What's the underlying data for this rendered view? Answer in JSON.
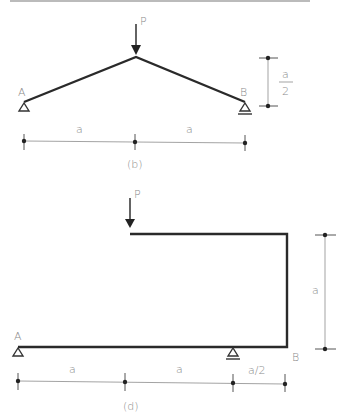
{
  "figures": [
    {
      "id": "b",
      "caption": "(b)",
      "load_label": "P",
      "support_left_label": "A",
      "support_right_label": "B",
      "support_left_type": "pin",
      "support_right_type": "roller",
      "horizontal_dimensions": [
        "a",
        "a"
      ],
      "vertical_dimension": {
        "numerator": "a",
        "denominator": "2"
      }
    },
    {
      "id": "d",
      "caption": "(d)",
      "load_label": "P",
      "support_left_label": "A",
      "support_right_label": "B",
      "support_left_type": "pin",
      "support_middle_type": "roller",
      "horizontal_dimensions": [
        "a",
        "a",
        "a/2"
      ],
      "vertical_dimension": "a"
    }
  ],
  "colors": {
    "member": "#2a2a2a",
    "label": "#8a8a8a",
    "dimension": "#999999"
  }
}
